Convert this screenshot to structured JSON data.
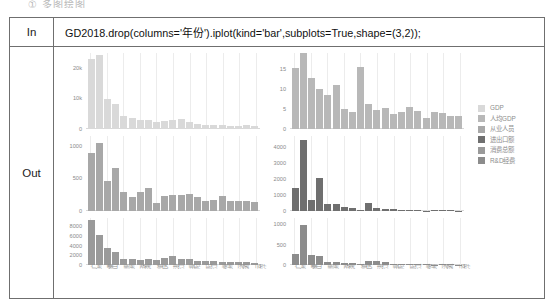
{
  "top_caption": "① 多图绘图",
  "notebook": {
    "in_label": "In",
    "out_label": "Out",
    "code": "GD2018.drop(columns='年份').iplot(kind='bar',subplots=True,shape=(3,2));"
  },
  "legend": {
    "position": "right",
    "items": [
      {
        "label": "GDP",
        "color": "#d9d9d9"
      },
      {
        "label": "人均GDP",
        "color": "#b8b8b8"
      },
      {
        "label": "从业人员",
        "color": "#a8a8a8"
      },
      {
        "label": "进出口额",
        "color": "#6f6f6f"
      },
      {
        "label": "消费总额",
        "color": "#9a9a9a"
      },
      {
        "label": "R&D经费",
        "color": "#8c8c8c"
      }
    ]
  },
  "categories": [
    "广州",
    "深圳",
    "佛山",
    "东莞",
    "惠州",
    "中山",
    "珠海",
    "江门",
    "肇庆",
    "汕头",
    "湛江",
    "茂名",
    "揭阳",
    "清远",
    "阳江",
    "韶关",
    "梅州",
    "汕尾",
    "河源",
    "潮州",
    "云浮"
  ],
  "chart_data": [
    {
      "type": "bar",
      "title": "GDP",
      "xlabel": "",
      "ylabel": "",
      "color": "#d9d9d9",
      "ylim": [
        0,
        25000
      ],
      "yticks": [
        0,
        10000,
        20000
      ],
      "ytick_labels": [
        "0",
        "10k",
        "20k"
      ],
      "grid": true,
      "categories": [
        "广州",
        "深圳",
        "佛山",
        "东莞",
        "惠州",
        "中山",
        "珠海",
        "江门",
        "肇庆",
        "汕头",
        "湛江",
        "茂名",
        "揭阳",
        "清远",
        "阳江",
        "韶关",
        "梅州",
        "汕尾",
        "河源",
        "潮州",
        "云浮"
      ],
      "values": [
        22859,
        24221,
        9936,
        8278,
        4103,
        3632,
        2915,
        2900,
        2202,
        2512,
        3008,
        3078,
        2149,
        1565,
        1352,
        1353,
        1110,
        900,
        1004,
        1080,
        830
      ]
    },
    {
      "type": "bar",
      "title": "人均GDP",
      "xlabel": "",
      "ylabel": "",
      "color": "#b8b8b8",
      "ylim": [
        0,
        19
      ],
      "yticks": [
        0,
        5,
        10,
        15
      ],
      "ytick_labels": [
        "0",
        "5",
        "10",
        "15"
      ],
      "grid": true,
      "categories": [
        "广州",
        "深圳",
        "佛山",
        "东莞",
        "惠州",
        "中山",
        "珠海",
        "江门",
        "肇庆",
        "汕头",
        "湛江",
        "茂名",
        "揭阳",
        "清远",
        "阳江",
        "韶关",
        "梅州",
        "汕尾",
        "河源",
        "潮州",
        "云浮"
      ],
      "values": [
        15.3,
        18.9,
        12.6,
        9.9,
        8.4,
        11.0,
        4.9,
        4.3,
        15.6,
        6.3,
        4.8,
        5.3,
        3.7,
        4.2,
        5.4,
        4.4,
        2.7,
        4.2,
        3.9,
        3.3,
        3.2
      ]
    },
    {
      "type": "bar",
      "title": "从业人员",
      "xlabel": "",
      "ylabel": "",
      "color": "#a8a8a8",
      "ylim": [
        0,
        1150
      ],
      "yticks": [
        0,
        500,
        1000
      ],
      "ytick_labels": [
        "0",
        "500",
        "1000"
      ],
      "grid": true,
      "categories": [
        "广州",
        "深圳",
        "佛山",
        "东莞",
        "惠州",
        "中山",
        "珠海",
        "江门",
        "肇庆",
        "汕头",
        "湛江",
        "茂名",
        "揭阳",
        "清远",
        "阳江",
        "韶关",
        "梅州",
        "汕尾",
        "河源",
        "潮州",
        "云浮"
      ],
      "values": [
        890,
        1045,
        455,
        660,
        295,
        215,
        290,
        350,
        130,
        240,
        245,
        250,
        270,
        225,
        155,
        175,
        230,
        160,
        150,
        155,
        140
      ]
    },
    {
      "type": "bar",
      "title": "进出口额",
      "xlabel": "",
      "ylabel": "",
      "color": "#6f6f6f",
      "ylim": [
        0,
        4700
      ],
      "yticks": [
        0,
        1000,
        2000,
        3000,
        4000
      ],
      "ytick_labels": [
        "0",
        "1000",
        "2000",
        "3000",
        "4000"
      ],
      "grid": true,
      "categories": [
        "广州",
        "深圳",
        "佛山",
        "东莞",
        "惠州",
        "中山",
        "珠海",
        "江门",
        "肇庆",
        "汕头",
        "湛江",
        "茂名",
        "揭阳",
        "清远",
        "阳江",
        "韶关",
        "梅州",
        "汕尾",
        "河源",
        "潮州",
        "云浮"
      ],
      "values": [
        1450,
        4450,
        680,
        2080,
        480,
        460,
        270,
        180,
        60,
        540,
        230,
        170,
        120,
        70,
        90,
        60,
        45,
        60,
        70,
        65,
        40
      ]
    },
    {
      "type": "bar",
      "title": "消费总额",
      "xlabel": "",
      "ylabel": "",
      "color": "#9a9a9a",
      "ylim": [
        0,
        9600
      ],
      "yticks": [
        0,
        2000,
        4000,
        6000,
        8000
      ],
      "ytick_labels": [
        "0",
        "2000",
        "4000",
        "6000",
        "8000"
      ],
      "grid": true,
      "categories": [
        "广州",
        "深圳",
        "佛山",
        "东莞",
        "惠州",
        "中山",
        "珠海",
        "江门",
        "肇庆",
        "汕头",
        "湛江",
        "茂名",
        "揭阳",
        "清远",
        "阳江",
        "韶关",
        "梅州",
        "汕尾",
        "河源",
        "潮州",
        "云浮"
      ],
      "values": [
        9256,
        6169,
        3400,
        2680,
        1220,
        1210,
        1130,
        1240,
        1050,
        1350,
        1900,
        1250,
        1150,
        880,
        800,
        760,
        720,
        620,
        560,
        540,
        480
      ]
    },
    {
      "type": "bar",
      "title": "R&D经费",
      "xlabel": "",
      "ylabel": "",
      "color": "#8c8c8c",
      "ylim": [
        0,
        1150
      ],
      "yticks": [
        0,
        500,
        1000
      ],
      "ytick_labels": [
        "0",
        "500",
        "1000"
      ],
      "grid": true,
      "categories": [
        "广州",
        "深圳",
        "佛山",
        "东莞",
        "惠州",
        "中山",
        "珠海",
        "江门",
        "肇庆",
        "汕头",
        "湛江",
        "茂名",
        "揭阳",
        "清远",
        "阳江",
        "韶关",
        "梅州",
        "汕尾",
        "河源",
        "潮州",
        "云浮"
      ],
      "values": [
        270,
        985,
        235,
        215,
        85,
        70,
        45,
        40,
        20,
        95,
        90,
        70,
        35,
        25,
        18,
        22,
        20,
        12,
        15,
        14,
        10
      ]
    }
  ]
}
